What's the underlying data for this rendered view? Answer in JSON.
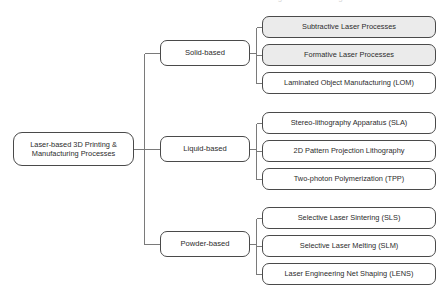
{
  "diagram": {
    "type": "tree",
    "orientation": "left-to-right",
    "title_clipped": "Laser-based 3D Printing & Manufacturing Processes",
    "colors": {
      "border": "#4a4a4a",
      "shaded_fill": "#ebebeb",
      "plain_fill": "#ffffff",
      "text": "#2b2b2b",
      "edge": "#7a7a7a",
      "background": "#ffffff"
    },
    "root": {
      "id": "root",
      "label": "Laser-based 3D Printing &\nManufacturing Processes",
      "shaded": false,
      "x": 13,
      "y": 132,
      "w": 121,
      "h": 34
    },
    "branches": [
      {
        "id": "solid-based",
        "label": "Solid-based",
        "shaded": false,
        "x": 160,
        "y": 40,
        "w": 90,
        "h": 26,
        "leaves": [
          {
            "id": "subtractive-laser-processes",
            "label": "Subtractive Laser Processes",
            "shaded": true,
            "x": 262,
            "y": 16,
            "w": 174,
            "h": 22
          },
          {
            "id": "formative-laser-processes",
            "label": "Formative Laser Processes",
            "shaded": true,
            "x": 262,
            "y": 44,
            "w": 174,
            "h": 22
          },
          {
            "id": "laminated-object-manufacturing",
            "label": "Laminated Object Manufacturing (LOM)",
            "shaded": false,
            "x": 262,
            "y": 72,
            "w": 174,
            "h": 22
          }
        ]
      },
      {
        "id": "liquid-based",
        "label": "Liquid-based",
        "shaded": false,
        "x": 160,
        "y": 136,
        "w": 90,
        "h": 26,
        "leaves": [
          {
            "id": "stereo-lithography-apparatus",
            "label": "Stereo-lithography Apparatus (SLA)",
            "shaded": false,
            "x": 262,
            "y": 112,
            "w": 174,
            "h": 22
          },
          {
            "id": "2d-pattern-projection-lithography",
            "label": "2D Pattern Projection Lithography",
            "shaded": false,
            "x": 262,
            "y": 140,
            "w": 174,
            "h": 22
          },
          {
            "id": "two-photon-polymerization",
            "label": "Two-photon Polymerization (TPP)",
            "shaded": false,
            "x": 262,
            "y": 168,
            "w": 174,
            "h": 22
          }
        ]
      },
      {
        "id": "powder-based",
        "label": "Powder-based",
        "shaded": false,
        "x": 160,
        "y": 231,
        "w": 90,
        "h": 26,
        "leaves": [
          {
            "id": "selective-laser-sintering",
            "label": "Selective Laser Sintering (SLS)",
            "shaded": false,
            "x": 262,
            "y": 207,
            "w": 174,
            "h": 22
          },
          {
            "id": "selective-laser-melting",
            "label": "Selective Laser Melting (SLM)",
            "shaded": false,
            "x": 262,
            "y": 235,
            "w": 174,
            "h": 22
          },
          {
            "id": "laser-engineering-net-shaping",
            "label": "Laser Engineering Net Shaping (LENS)",
            "shaded": false,
            "x": 262,
            "y": 263,
            "w": 174,
            "h": 22
          }
        ]
      }
    ]
  }
}
